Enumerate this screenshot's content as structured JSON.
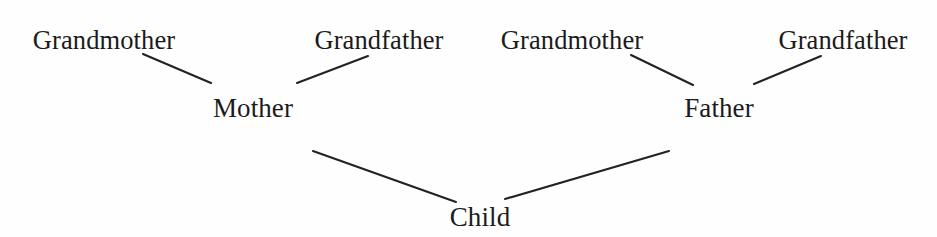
{
  "diagram": {
    "type": "genealogy-tree",
    "background_color": "#fefefe",
    "line_color": "#222222",
    "text_color": "#1b1b1b",
    "nodes": [
      {
        "id": "grandmother-maternal",
        "label": "Grandmother",
        "generation": 1,
        "x": 104,
        "y": 27
      },
      {
        "id": "grandfather-maternal",
        "label": "Grandfather",
        "generation": 1,
        "x": 379,
        "y": 27
      },
      {
        "id": "grandmother-paternal",
        "label": "Grandmother",
        "generation": 1,
        "x": 572,
        "y": 27
      },
      {
        "id": "grandfather-paternal",
        "label": "Grandfather",
        "generation": 1,
        "x": 843,
        "y": 27
      },
      {
        "id": "mother",
        "label": "Mother",
        "generation": 2,
        "x": 253,
        "y": 95
      },
      {
        "id": "father",
        "label": "Father",
        "generation": 2,
        "x": 719,
        "y": 95
      },
      {
        "id": "child",
        "label": "Child",
        "generation": 3,
        "x": 480,
        "y": 204
      }
    ],
    "edges": [
      {
        "id": "edge-grandmother-maternal-mother",
        "from": "grandmother-maternal",
        "to": "mother",
        "x1": 143,
        "y1": 54,
        "x2": 211,
        "y2": 83
      },
      {
        "id": "edge-grandfather-maternal-mother",
        "from": "grandfather-maternal",
        "to": "mother",
        "x1": 297,
        "y1": 83,
        "x2": 368,
        "y2": 56
      },
      {
        "id": "edge-grandmother-paternal-father",
        "from": "grandmother-paternal",
        "to": "father",
        "x1": 631,
        "y1": 55,
        "x2": 693,
        "y2": 85
      },
      {
        "id": "edge-grandfather-paternal-father",
        "from": "grandfather-paternal",
        "to": "father",
        "x1": 754,
        "y1": 84,
        "x2": 821,
        "y2": 56
      },
      {
        "id": "edge-mother-child",
        "from": "mother",
        "to": "child",
        "x1": 313,
        "y1": 151,
        "x2": 456,
        "y2": 202
      },
      {
        "id": "edge-father-child",
        "from": "father",
        "to": "child",
        "x1": 505,
        "y1": 199,
        "x2": 669,
        "y2": 151
      }
    ]
  }
}
